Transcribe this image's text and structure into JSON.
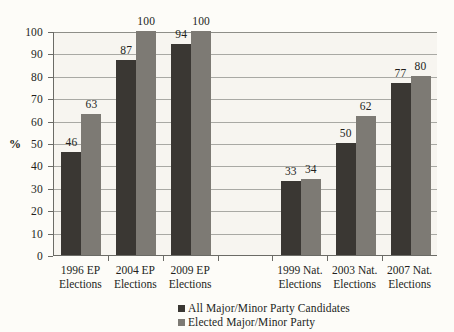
{
  "chart_data": {
    "type": "bar",
    "title": "",
    "xlabel": "",
    "ylabel": "%",
    "ylim": [
      0,
      100
    ],
    "ytick_step": 10,
    "yticks": [
      0,
      10,
      20,
      30,
      40,
      50,
      60,
      70,
      80,
      90,
      100
    ],
    "grid": true,
    "legend_position": "bottom",
    "categories": [
      "1996 EP Elections",
      "2004 EP Elections",
      "2009 EP Elections",
      "",
      "1999 Nat. Elections",
      "2003 Nat. Elections",
      "2007 Nat. Elections"
    ],
    "category_lines": [
      [
        "1996 EP",
        "Elections"
      ],
      [
        "2004 EP",
        "Elections"
      ],
      [
        "2009 EP",
        "Elections"
      ],
      [
        "",
        ""
      ],
      [
        "1999 Nat.",
        "Elections"
      ],
      [
        "2003 Nat.",
        "Elections"
      ],
      [
        "2007 Nat.",
        "Elections"
      ]
    ],
    "series": [
      {
        "name": "All Major/Minor Party Candidates",
        "color": "#3a3733",
        "values": [
          46,
          87,
          94,
          null,
          33,
          50,
          77
        ]
      },
      {
        "name": "Elected Major/Minor Party",
        "color": "#7d7a74",
        "values": [
          63,
          100,
          100,
          null,
          34,
          62,
          80
        ]
      }
    ]
  },
  "legend": {
    "items": [
      {
        "label": "All Major/Minor Party Candidates",
        "swatch": "#3a3733"
      },
      {
        "label": "Elected Major/Minor Party",
        "swatch": "#7d7a74"
      }
    ]
  },
  "axis": {
    "y_title": "%"
  }
}
